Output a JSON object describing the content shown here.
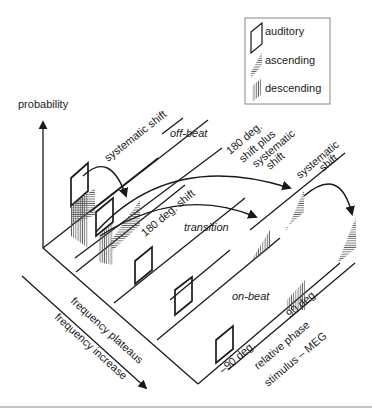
{
  "legend": {
    "items": [
      {
        "label": "auditory",
        "icon": "parallelogram-outline-icon"
      },
      {
        "label": "ascending",
        "icon": "horizontal-hatch-icon"
      },
      {
        "label": "descending",
        "icon": "vertical-hatch-icon"
      }
    ]
  },
  "axes": {
    "y_label": "probability",
    "x_label_1": "frequency plateaus",
    "x_label_2": "frequency increase",
    "z_label_1": "relative phase",
    "z_label_2": "stimulus – MEG",
    "tick_neg90": "–90 deg.",
    "tick_90": "90 deg."
  },
  "regions": {
    "off_beat": "off-beat",
    "transition": "transition",
    "on_beat": "on-beat"
  },
  "annotations": {
    "systematic_shift_1": "systematic shift",
    "shift_180": "180 deg. shift",
    "shift_180_plus_l1": "180 deg.",
    "shift_180_plus_l2": "shift plus",
    "shift_180_plus_l3": "systematic",
    "shift_180_plus_l4": "shift",
    "systematic_shift_2_l1": "systematic",
    "systematic_shift_2_l2": "shift"
  },
  "colors": {
    "ink": "#1a1a1a",
    "hatch": "#555555",
    "border": "#888888"
  }
}
